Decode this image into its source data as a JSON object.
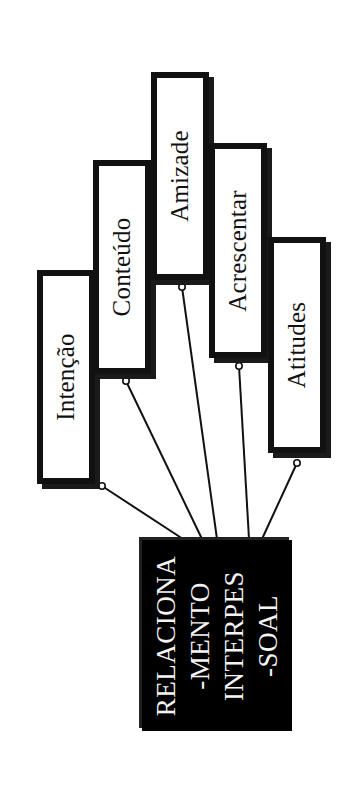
{
  "diagram": {
    "type": "mind-map",
    "orientation": "rotated -90deg (text reads bottom-to-top)",
    "center": {
      "lines": [
        "RELACIONA",
        "-MENTO",
        "INTERPES",
        "-SOAL"
      ],
      "full_text": "RELACIONAMENTO INTERPESSOAL",
      "background": "#000000",
      "text_color": "#f4f4f4"
    },
    "branches": [
      {
        "label": "Intenção"
      },
      {
        "label": "Conteúdo"
      },
      {
        "label": "Amizade"
      },
      {
        "label": "Acrescentar"
      },
      {
        "label": "Atitudes"
      }
    ],
    "colors": {
      "border": "#111111",
      "background": "#ffffff",
      "connector": "#111111"
    }
  }
}
